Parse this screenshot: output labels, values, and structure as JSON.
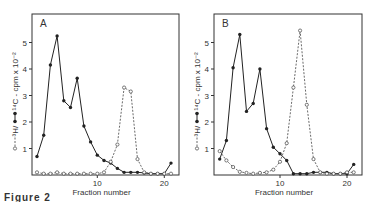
{
  "figure": {
    "caption": "Figure 2",
    "ylabel": "○---○ ³H/●—● ¹⁴C - cpm × 10⁻²",
    "xlabel": "Fraction number"
  },
  "chart_data": [
    {
      "type": "line",
      "panel": "A",
      "title": "A",
      "xlabel": "Fraction number",
      "ylabel": "³H / ¹⁴C - cpm x 10⁻²",
      "x_ticks": [
        10,
        20
      ],
      "y_ticks": [
        1,
        2,
        3,
        4,
        5
      ],
      "xlim": [
        0,
        22
      ],
      "ylim": [
        0,
        5.9
      ],
      "grid": false,
      "x": [
        1,
        2,
        3,
        4,
        5,
        6,
        7,
        8,
        9,
        10,
        11,
        12,
        13,
        14,
        15,
        16,
        17,
        18,
        19,
        20,
        21
      ],
      "series": [
        {
          "name": "solid (filled circles)",
          "style": "solid",
          "values": [
            0.7,
            1.5,
            4.15,
            5.25,
            2.8,
            2.55,
            3.65,
            1.85,
            1.25,
            0.75,
            0.55,
            0.45,
            0.25,
            0.1,
            0.1,
            0.1,
            0.08,
            0.05,
            0.05,
            0.05,
            0.45
          ]
        },
        {
          "name": "dashed (open circles)",
          "style": "dashed",
          "values": [
            0.1,
            0.05,
            0.05,
            0.1,
            0.05,
            0.05,
            0.05,
            0.05,
            0.05,
            0.05,
            0.1,
            0.5,
            1.15,
            3.3,
            3.15,
            0.6,
            0.1,
            0.05,
            0.05,
            0.05,
            0.05
          ]
        }
      ]
    },
    {
      "type": "line",
      "panel": "B",
      "title": "B",
      "xlabel": "Fraction number",
      "ylabel": "³H / ¹⁴C - cpm x 10⁻²",
      "x_ticks": [
        10,
        20
      ],
      "y_ticks": [
        1,
        2,
        3,
        4,
        5
      ],
      "xlim": [
        0,
        22
      ],
      "ylim": [
        0,
        5.9
      ],
      "grid": false,
      "x": [
        1,
        2,
        3,
        4,
        5,
        6,
        7,
        8,
        9,
        10,
        11,
        12,
        13,
        14,
        15,
        16,
        17,
        18,
        19,
        20,
        21
      ],
      "series": [
        {
          "name": "solid (filled circles)",
          "style": "solid",
          "values": [
            0.6,
            1.3,
            4.05,
            5.3,
            2.4,
            2.7,
            4.0,
            1.75,
            1.05,
            0.8,
            0.55,
            0.05,
            0.05,
            0.05,
            0.1,
            0.1,
            0.1,
            0.05,
            0.05,
            0.05,
            0.4
          ]
        },
        {
          "name": "dashed (open circles)",
          "style": "dashed",
          "values": [
            0.9,
            0.55,
            0.3,
            0.12,
            0.08,
            0.05,
            0.08,
            0.1,
            0.2,
            0.5,
            1.2,
            3.3,
            5.45,
            2.65,
            0.6,
            0.1,
            0.05,
            0.05,
            0.05,
            0.1,
            0.1
          ]
        }
      ]
    }
  ]
}
